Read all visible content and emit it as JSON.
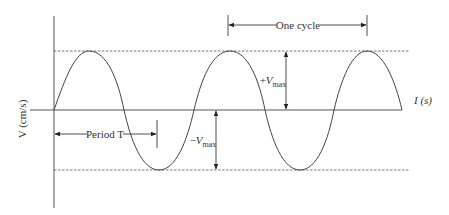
{
  "diagram": {
    "type": "sine-wave-amplitude-period",
    "y_axis_label": "V (cm/s)",
    "x_axis_label": "I (s)",
    "annotations": {
      "one_cycle": "One cycle",
      "period": "Period T",
      "plus_vmax_sign": "+",
      "minus_vmax_sign": "−",
      "vmax_symbol": "V",
      "vmax_subscript": "max"
    },
    "colors": {
      "curve": "#444444",
      "axis": "#555555",
      "dashed": "#666666",
      "arrows": "#222222"
    }
  }
}
